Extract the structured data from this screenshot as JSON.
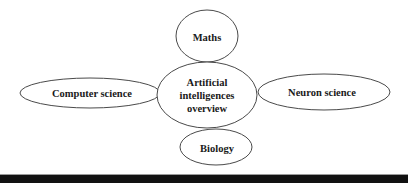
{
  "diagram": {
    "title": "",
    "center": {
      "label_lines": [
        "Artificial",
        "intelligences",
        "overview"
      ]
    },
    "nodes": [
      {
        "id": "maths",
        "label": "Maths"
      },
      {
        "id": "computer-science",
        "label": "Computer science"
      },
      {
        "id": "neuron-science",
        "label": "Neuron science"
      },
      {
        "id": "biology",
        "label": "Biology"
      }
    ],
    "colors": {
      "stroke": "#4a4a4a",
      "fill": "#ffffff",
      "text": "#1a1a1a",
      "rule": "#111111"
    }
  }
}
